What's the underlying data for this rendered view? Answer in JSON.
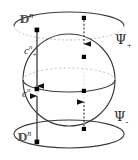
{
  "figure": {
    "kind": "mathematical-diagram",
    "labels": {
      "disk_top": {
        "base": "D",
        "sup": "n",
        "text": "D^n"
      },
      "disk_bottom": {
        "base": "D",
        "sup": "n",
        "text": "D^n"
      },
      "cell_upper": {
        "base": "c",
        "sub": "+",
        "sup": "n",
        "text": "c_+^n"
      },
      "cell_lower": {
        "base": "c",
        "sub": "-",
        "sup": "n",
        "text": "c_-^n"
      },
      "map_upper": {
        "base": "Ψ",
        "sub": "+",
        "text": "Ψ_+"
      },
      "map_lower": {
        "base": "Ψ",
        "sub": "-",
        "text": "Ψ_-"
      }
    },
    "colors": {
      "stroke": "#333333",
      "hidden_stroke": "#b0b0b0",
      "dot": "#000000",
      "label": "#2b2b2b",
      "disk_label": "#555555",
      "background": "#ffffff"
    },
    "geometry": {
      "sphere_center_x": 69,
      "sphere_center_y": 80,
      "sphere_radius_x": 46,
      "sphere_radius_y": 46,
      "equator_ry": 12,
      "top_disk_cy": 26,
      "top_disk_rx": 55,
      "top_disk_ry": 14,
      "bottom_disk_cy": 134,
      "bottom_disk_rx": 55,
      "bottom_disk_ry": 14
    },
    "arrows": [
      {
        "name": "left-upper-arrow",
        "direction": "down",
        "x": 37,
        "from_y": 30,
        "to_y": 88,
        "style": "solid"
      },
      {
        "name": "right-upper-arrow",
        "direction": "down",
        "x": 84,
        "from_y": 18,
        "to_y": 56,
        "style": "dotted"
      },
      {
        "name": "left-lower-arrow",
        "direction": "up",
        "x": 37,
        "from_y": 142,
        "to_y": 90,
        "style": "solid"
      },
      {
        "name": "right-lower-arrow",
        "direction": "up",
        "x": 84,
        "from_y": 128,
        "to_y": 92,
        "style": "dotted"
      }
    ],
    "points": [
      {
        "name": "point-top-left-rim",
        "x": 37,
        "y": 30
      },
      {
        "name": "point-top-right-disk",
        "x": 84,
        "y": 18
      },
      {
        "name": "point-upper-right-sphere",
        "x": 84,
        "y": 57
      },
      {
        "name": "point-equator-left",
        "x": 37,
        "y": 89
      },
      {
        "name": "point-lower-right-sphere",
        "x": 84,
        "y": 91
      },
      {
        "name": "point-bottom-right-disk",
        "x": 84,
        "y": 129
      },
      {
        "name": "point-bottom-left-rim",
        "x": 37,
        "y": 142
      }
    ]
  }
}
